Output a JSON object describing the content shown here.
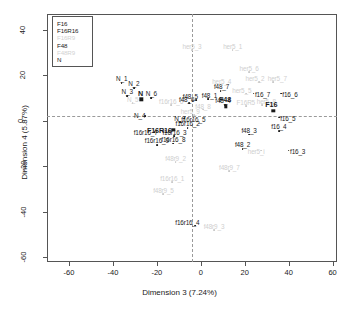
{
  "chart_data": {
    "type": "scatter",
    "title": "",
    "xlabel": "Dimension 3 (7.24%)",
    "ylabel": "Dimension 4 (5.87%)",
    "xlim": [
      -70,
      62
    ],
    "ylim": [
      -62,
      47
    ],
    "xticks": [
      "-60",
      "-40",
      "-20",
      "0",
      "20",
      "40",
      "60"
    ],
    "xtick_values": [
      -60,
      -40,
      -20,
      0,
      20,
      40,
      60
    ],
    "yticks": [
      "40",
      "20",
      "0",
      "-20",
      "-40",
      "-60"
    ],
    "ytick_values": [
      40,
      20,
      0,
      -20,
      -40,
      -60
    ],
    "grid": false,
    "reference_lines": {
      "vertical_at_x": 0,
      "horizontal_at_y": 0,
      "style": "dotted"
    },
    "legend": {
      "position": "top-left",
      "entries": [
        {
          "label": "F16",
          "color": "#1a1a1a",
          "dim": false
        },
        {
          "label": "F16R16",
          "color": "#1a1a1a",
          "dim": false
        },
        {
          "label": "F16R9",
          "color": "#d2d2d2",
          "dim": true
        },
        {
          "label": "F48",
          "color": "#1a1a1a",
          "dim": false
        },
        {
          "label": "F48R9",
          "color": "#d2d2d2",
          "dim": true
        },
        {
          "label": "N",
          "color": "#1a1a1a",
          "dim": false
        }
      ]
    },
    "centroids": [
      {
        "label": "F16",
        "x": 33.0,
        "y": 4.5,
        "label_dx": -2,
        "label_dy": -7
      },
      {
        "label": "F16R16",
        "x": -12.5,
        "y": -4.0,
        "label_dx": -14,
        "label_dy": 0
      },
      {
        "label": "F48",
        "x": 11.5,
        "y": 6.5,
        "label_dx": -1,
        "label_dy": -7
      },
      {
        "label": "N",
        "x": -27.0,
        "y": 9.5,
        "label_dx": -1,
        "label_dy": -6
      }
    ],
    "points": [
      {
        "label": "N_1",
        "x": -36.0,
        "y": 16.5,
        "dim": false,
        "label_dx": 0,
        "label_dy": -5
      },
      {
        "label": "N_2",
        "x": -30.5,
        "y": 14.5,
        "dim": false,
        "label_dx": 0,
        "label_dy": -5
      },
      {
        "label": "N_3",
        "x": -33.5,
        "y": 11.0,
        "dim": false,
        "label_dx": 0,
        "label_dy": -5
      },
      {
        "label": "N_6",
        "x": -22.5,
        "y": 10.0,
        "dim": false,
        "label_dx": 0,
        "label_dy": -5
      },
      {
        "label": "N_4",
        "x": -25.5,
        "y": 2.0,
        "dim": false,
        "label_dx": -5,
        "label_dy": -1
      },
      {
        "label": "N_7",
        "x": -9.5,
        "y": -0.5,
        "dim": false,
        "label_dx": 0,
        "label_dy": -4
      },
      {
        "label": "N_5",
        "x": -31.0,
        "y": 8.0,
        "dim": true,
        "label_dx": 0,
        "label_dy": -4
      },
      {
        "label": "f16r16_7",
        "x": -21.0,
        "y": -5.0,
        "dim": false,
        "label_dx": -9,
        "label_dy": 0
      },
      {
        "label": "f16r16_5",
        "x": -7.5,
        "y": 1.0,
        "dim": false,
        "label_dx": 9,
        "label_dy": 0
      },
      {
        "label": "f16r16_2",
        "x": -6.0,
        "y": -3.0,
        "dim": false,
        "label_dx": 0,
        "label_dy": -5
      },
      {
        "label": "f16r16_9",
        "x": -20.0,
        "y": -10.5,
        "dim": false,
        "label_dx": 0,
        "label_dy": -5
      },
      {
        "label": "f16r16_8",
        "x": -12.5,
        "y": -10.0,
        "dim": false,
        "label_dx": 0,
        "label_dy": -5
      },
      {
        "label": "f16r16_3",
        "x": -12.0,
        "y": -6.5,
        "dim": false,
        "label_dx": 0,
        "label_dy": -4
      },
      {
        "label": "f16r16_6",
        "x": -13.5,
        "y": 7.0,
        "dim": true,
        "label_dx": 0,
        "label_dy": -4
      },
      {
        "label": "f16r16_4",
        "x": -2.5,
        "y": -46.0,
        "dim": false,
        "label_dx": -8,
        "label_dy": -4
      },
      {
        "label": "f16r16_1",
        "x": -13.0,
        "y": -27.0,
        "dim": true,
        "label_dx": 0,
        "label_dy": -4
      },
      {
        "label": "f48_7",
        "x": 9.0,
        "y": 13.0,
        "dim": false,
        "label_dx": 1,
        "label_dy": -5
      },
      {
        "label": "f48_1",
        "x": 3.5,
        "y": 9.5,
        "dim": false,
        "label_dx": 1,
        "label_dy": -4
      },
      {
        "label": "f48_5",
        "x": -2.0,
        "y": 9.0,
        "dim": false,
        "label_dx": -6,
        "label_dy": -4
      },
      {
        "label": "f48_6",
        "x": -5.5,
        "y": 8.0,
        "dim": false,
        "label_dx": -2,
        "label_dy": -4
      },
      {
        "label": "f48_4",
        "x": 11.0,
        "y": 7.0,
        "dim": false,
        "label_dx": -2,
        "label_dy": -5
      },
      {
        "label": "f48_8",
        "x": 1.0,
        "y": 5.0,
        "dim": true,
        "label_dx": 0,
        "label_dy": -4
      },
      {
        "label": "f48_3",
        "x": 22.0,
        "y": -6.0,
        "dim": false,
        "label_dx": 0,
        "label_dy": -5
      },
      {
        "label": "f48_2",
        "x": 19.0,
        "y": -12.5,
        "dim": false,
        "label_dx": 0,
        "label_dy": -5
      },
      {
        "label": "f16_7",
        "x": 24.0,
        "y": 12.0,
        "dim": false,
        "label_dx": 9,
        "label_dy": 0
      },
      {
        "label": "f16_6",
        "x": 36.5,
        "y": 12.0,
        "dim": false,
        "label_dx": 9,
        "label_dy": 0
      },
      {
        "label": "f16_5",
        "x": 35.5,
        "y": 1.5,
        "dim": false,
        "label_dx": 9,
        "label_dy": 0
      },
      {
        "label": "f16_4",
        "x": 35.5,
        "y": -4.5,
        "dim": false,
        "label_dx": 0,
        "label_dy": -5
      },
      {
        "label": "f16_3",
        "x": 40.0,
        "y": -13.0,
        "dim": false,
        "label_dx": 9,
        "label_dy": 0
      },
      {
        "label": "her5_3",
        "x": -4.0,
        "y": 31.0,
        "dim": true,
        "label_dx": 0,
        "label_dy": -4
      },
      {
        "label": "her5_1",
        "x": 14.5,
        "y": 31.0,
        "dim": true,
        "label_dx": 0,
        "label_dy": -4
      },
      {
        "label": "her5_6",
        "x": 22.0,
        "y": 21.5,
        "dim": true,
        "label_dx": 0,
        "label_dy": -4
      },
      {
        "label": "her5_2",
        "x": 26.5,
        "y": 17.0,
        "dim": true,
        "label_dx": -4,
        "label_dy": -4
      },
      {
        "label": "her5_7",
        "x": 33.0,
        "y": 17.0,
        "dim": true,
        "label_dx": 4,
        "label_dy": -4
      },
      {
        "label": "her5_5",
        "x": 20.5,
        "y": 12.0,
        "dim": true,
        "label_dx": -4,
        "label_dy": -4
      },
      {
        "label": "her5_4",
        "x": 9.5,
        "y": 16.0,
        "dim": true,
        "label_dx": 0,
        "label_dy": -4
      },
      {
        "label": "F16R5",
        "x": 20.5,
        "y": 6.5,
        "dim": true,
        "label_dx": 0,
        "label_dy": -4
      },
      {
        "label": "her5_8",
        "x": 28.0,
        "y": 7.0,
        "dim": true,
        "label_dx": 4,
        "label_dy": -4
      },
      {
        "label": "her5_9",
        "x": -3.0,
        "y": 2.5,
        "dim": true,
        "label_dx": -4,
        "label_dy": -4
      },
      {
        "label": "her5_i",
        "x": 27.5,
        "y": -13.0,
        "dim": true,
        "label_dx": -5,
        "label_dy": 0
      },
      {
        "label": "f48r9_2",
        "x": -11.5,
        "y": -18.0,
        "dim": true,
        "label_dx": 0,
        "label_dy": -4
      },
      {
        "label": "f48r9_5",
        "x": -17.0,
        "y": -32.0,
        "dim": true,
        "label_dx": 0,
        "label_dy": -4
      },
      {
        "label": "f48r9_3",
        "x": 6.0,
        "y": -48.0,
        "dim": true,
        "label_dx": 0,
        "label_dy": -4
      },
      {
        "label": "f48r9_7",
        "x": 13.0,
        "y": -22.0,
        "dim": true,
        "label_dx": 0,
        "label_dy": -4
      }
    ]
  }
}
